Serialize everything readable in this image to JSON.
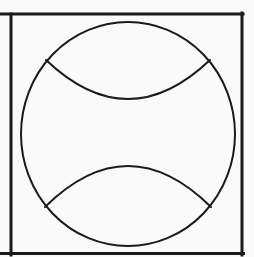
{
  "canvas": {
    "width": 254,
    "height": 257,
    "background": "#fafafa",
    "stroke_color": "#1a1a1a"
  },
  "figure": {
    "frame": {
      "top_line": {
        "x1": 0,
        "y1": 14,
        "x2": 243,
        "y2": 14,
        "stroke_width": 3
      },
      "left_line": {
        "x1": 11,
        "y1": 14,
        "x2": 11,
        "y2": 255,
        "stroke_width": 3
      },
      "right_line": {
        "x1": 242,
        "y1": 13,
        "x2": 242,
        "y2": 255,
        "stroke_width": 3
      },
      "bottom_line": {
        "x1": 0,
        "y1": 253.5,
        "x2": 243.5,
        "y2": 253.5,
        "stroke_width": 3
      }
    },
    "ball": {
      "cx": 128,
      "cy": 134,
      "rx": 107,
      "ry": 112,
      "stroke_width": 2
    },
    "seams": [
      {
        "name": "top-seam",
        "d": "M 46 60 Q 128 138 210 60",
        "stroke_width": 2
      },
      {
        "name": "bottom-seam",
        "d": "M 45 207 Q 128 125 211 207",
        "stroke_width": 2
      }
    ]
  }
}
